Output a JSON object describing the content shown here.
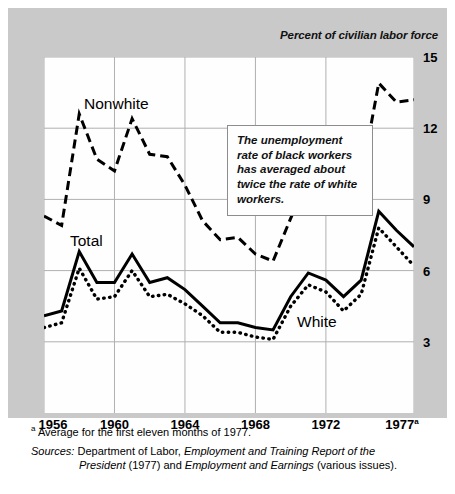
{
  "chart_title_axis": "Percent of civilian labor force",
  "callout": {
    "text": "The unemployment rate of black workers has averaged about twice the rate of white workers."
  },
  "series_labels": {
    "nonwhite": "Nonwhite",
    "total": "Total",
    "white": "White"
  },
  "footnotes": {
    "marker": "a",
    "note_a": "Average for the first eleven months of 1977.",
    "sources_label": "Sources:",
    "sources_line1_part1": "Department of Labor, ",
    "sources_line1_italic": "Employment and Training Report of the",
    "sources_line2_italic1": "President",
    "sources_line2_part2": " (1977) and ",
    "sources_line2_italic2": "Employment and Earnings",
    "sources_line2_part3": " (various issues)."
  },
  "colors": {
    "panel": "#c9c9c9",
    "plot_background": "#fefefe",
    "grid": "#b0b0b0",
    "line": "#000000",
    "callout_border": "#8d8d8d"
  },
  "chart_data": {
    "type": "line",
    "title": "",
    "subtitle": "",
    "xlabel": "",
    "ylabel": "Percent of civilian labor force",
    "xlim": [
      1956,
      1977
    ],
    "ylim": [
      0,
      15
    ],
    "yticks": [
      3,
      6,
      9,
      12,
      15
    ],
    "xticks": [
      1956,
      1960,
      1964,
      1968,
      1972,
      1977
    ],
    "xtick_labels": [
      "1956",
      "1960",
      "1964",
      "1968",
      "1972",
      "1977a"
    ],
    "grid": true,
    "legend": "inline-labels",
    "annotations": [
      "The unemployment rate of black workers has averaged about twice the rate of white workers."
    ],
    "x": [
      1956,
      1957,
      1958,
      1959,
      1960,
      1961,
      1962,
      1963,
      1964,
      1965,
      1966,
      1967,
      1968,
      1969,
      1970,
      1971,
      1972,
      1973,
      1974,
      1975,
      1976,
      1977
    ],
    "series": [
      {
        "name": "Nonwhite",
        "style": "dashed",
        "values": [
          8.3,
          7.9,
          12.6,
          10.7,
          10.2,
          12.4,
          10.9,
          10.8,
          9.6,
          8.1,
          7.3,
          7.4,
          6.7,
          6.4,
          8.2,
          9.9,
          10.0,
          8.9,
          9.9,
          13.9,
          13.1,
          13.2
        ]
      },
      {
        "name": "Total",
        "style": "solid",
        "values": [
          4.1,
          4.3,
          6.8,
          5.5,
          5.5,
          6.7,
          5.5,
          5.7,
          5.2,
          4.5,
          3.8,
          3.8,
          3.6,
          3.5,
          4.9,
          5.9,
          5.6,
          4.9,
          5.6,
          8.5,
          7.7,
          7.0
        ]
      },
      {
        "name": "White",
        "style": "dotted",
        "values": [
          3.6,
          3.8,
          6.1,
          4.8,
          4.9,
          6.0,
          4.9,
          5.0,
          4.6,
          4.1,
          3.4,
          3.4,
          3.2,
          3.1,
          4.5,
          5.4,
          5.1,
          4.3,
          5.0,
          7.8,
          7.0,
          6.2
        ]
      }
    ]
  }
}
